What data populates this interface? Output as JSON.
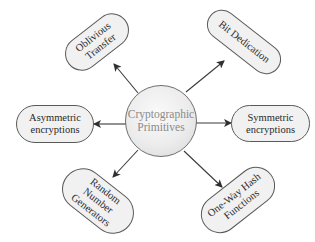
{
  "diagram": {
    "type": "hub-and-spoke",
    "center": {
      "line1": "Cryptographic",
      "line2": "Primitives"
    },
    "nodes": [
      {
        "id": "ot",
        "line1": "Oblivious",
        "line2": "Transfer",
        "line3": null
      },
      {
        "id": "bd",
        "line1": "Bit Dedication",
        "line2": null,
        "line3": null
      },
      {
        "id": "ae",
        "line1": "Asymmetric",
        "line2": "encryptions",
        "line3": null
      },
      {
        "id": "se",
        "line1": "Symmetric",
        "line2": "encryptions",
        "line3": null
      },
      {
        "id": "rng",
        "line1": "Random",
        "line2": "Number",
        "line3": "Generators"
      },
      {
        "id": "owh",
        "line1": "One-Way Hash",
        "line2": "Functions",
        "line3": null
      }
    ],
    "edges": [
      {
        "from": "center",
        "to": "ot",
        "direction": "outward"
      },
      {
        "from": "center",
        "to": "bd",
        "direction": "outward"
      },
      {
        "from": "center",
        "to": "ae",
        "direction": "outward"
      },
      {
        "from": "center",
        "to": "se",
        "direction": "outward"
      },
      {
        "from": "center",
        "to": "rng",
        "direction": "outward"
      },
      {
        "from": "center",
        "to": "owh",
        "direction": "outward"
      }
    ],
    "colors": {
      "line": "#3a3a3a",
      "node_fill": "#f1f1f1",
      "node_border": "#5a5a5a",
      "center_text": "#8a8a8a",
      "node_text": "#2a2a2a"
    }
  }
}
